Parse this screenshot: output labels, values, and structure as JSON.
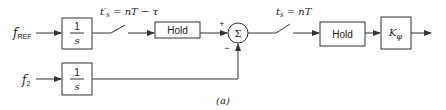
{
  "diagram": {
    "inputs": {
      "f_ref": {
        "main": "f",
        "sub": "REF"
      },
      "f_2": {
        "main": "f",
        "sub": "2"
      }
    },
    "integrator_1": {
      "num": "1",
      "den": "s"
    },
    "integrator_2": {
      "num": "1",
      "den": "s"
    },
    "switch_1_label": "t′s = nT − τ",
    "switch_1": {
      "t": "t",
      "prime": "′",
      "sub": "s",
      "rest": " = nT − τ"
    },
    "hold_1": "Hold",
    "summer": {
      "symbol": "Σ",
      "plus": "+",
      "minus": "−"
    },
    "switch_2": {
      "t": "t",
      "sub": "s",
      "rest": " = nT"
    },
    "hold_2": "Hold",
    "gain": {
      "main": "K",
      "sub": "φ"
    },
    "caption": "(a)"
  }
}
